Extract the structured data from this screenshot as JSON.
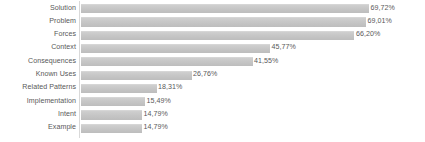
{
  "chart_data": {
    "type": "bar",
    "orientation": "horizontal",
    "title": "",
    "subtitle": "",
    "xlabel": "",
    "ylabel": "",
    "grid": false,
    "legend": false,
    "legend_position": "none",
    "value_suffix": "%",
    "decimal_separator": ",",
    "xlim": [
      0,
      69.72
    ],
    "categories": [
      "Solution",
      "Problem",
      "Forces",
      "Context",
      "Consequences",
      "Known Uses",
      "Related Patterns",
      "Implementation",
      "Intent",
      "Example"
    ],
    "values": [
      69.72,
      69.01,
      66.2,
      45.77,
      41.55,
      26.76,
      18.31,
      15.49,
      14.79,
      14.79
    ],
    "value_labels": [
      "69,72%",
      "69,01%",
      "66,20%",
      "45,77%",
      "41,55%",
      "26,76%",
      "18,31%",
      "15,49%",
      "14,79%",
      "14,79%"
    ],
    "colors": {
      "bar_fill": "#c6c6c6",
      "bar_fill_light": "#cfcfcf",
      "bar_fill_dark": "#bdbdbd",
      "text": "#595959",
      "axis_line": "#d9d9d9",
      "background": "#ffffff"
    }
  }
}
